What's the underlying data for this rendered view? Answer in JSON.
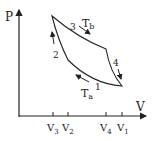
{
  "diagram": {
    "type": "PV cycle",
    "axes": {
      "y_label": "P",
      "x_label": "V"
    },
    "ticks": [
      {
        "label": "V",
        "sub": "3",
        "x": 53
      },
      {
        "label": "V",
        "sub": "2",
        "x": 68
      },
      {
        "label": "V",
        "sub": "4",
        "x": 106
      },
      {
        "label": "V",
        "sub": "1",
        "x": 122
      }
    ],
    "process_labels": {
      "p1": "1",
      "p2": "2",
      "p3": "3",
      "p4": "4"
    },
    "isotherms": {
      "hot": "T",
      "hot_sub": "b",
      "cold": "T",
      "cold_sub": "a"
    }
  }
}
